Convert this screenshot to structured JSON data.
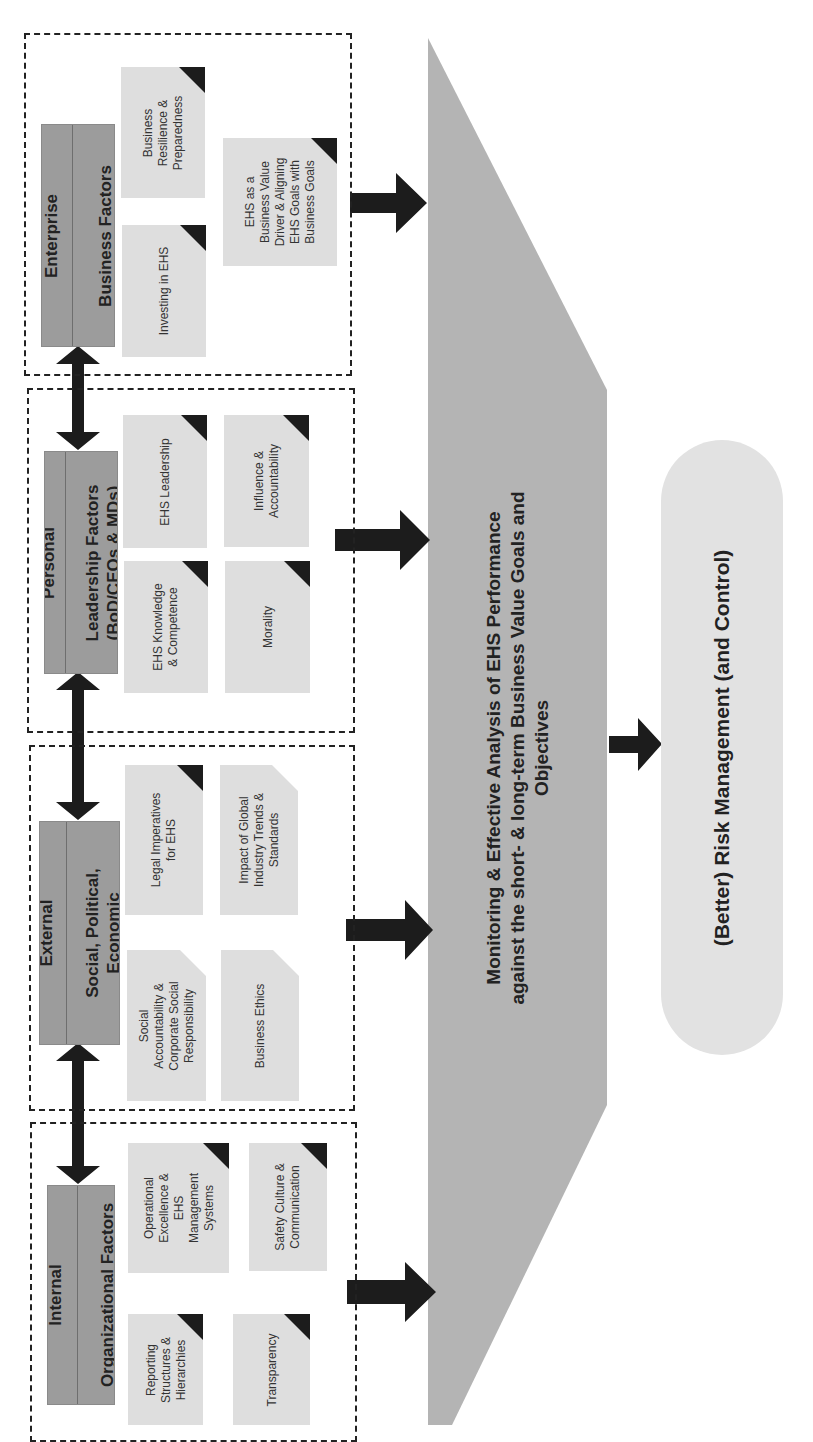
{
  "diagram": {
    "orientation": "rotated -90deg (text reads bottom-to-top)",
    "sections": [
      {
        "id": "enterprise",
        "header": {
          "line1": "Enterprise",
          "line2": "Business Factors"
        },
        "cards": [
          {
            "label": "Business\nResilience &\nPreparedness",
            "marker": "black-corner"
          },
          {
            "label": "Investing in EHS",
            "marker": "black-corner"
          },
          {
            "label": "EHS as a\nBusiness Value\nDriver & Aligning\nEHS Goals with\nBusiness Goals",
            "marker": "black-corner"
          }
        ]
      },
      {
        "id": "personal",
        "header": {
          "line1": "Personal",
          "line2": "Leadership Factors\n(BoD/CEOs & MDs)"
        },
        "cards": [
          {
            "label": "EHS Leadership",
            "marker": "black-corner"
          },
          {
            "label": "EHS Knowledge\n& Competence",
            "marker": "black-corner"
          },
          {
            "label": "Influence &\nAccountability",
            "marker": "black-corner"
          },
          {
            "label": "Morality",
            "marker": "black-corner"
          }
        ]
      },
      {
        "id": "external",
        "header": {
          "line1": "External",
          "line2": "Social, Political,\nEconomic"
        },
        "cards": [
          {
            "label": "Legal Imperatives\nfor EHS",
            "marker": "black-corner"
          },
          {
            "label": "Social\nAccountability &\nCorporate Social\nResponsibility",
            "marker": "folded-corner"
          },
          {
            "label": "Impact of Global\nIndustry Trends &\nStandards",
            "marker": "folded-corner"
          },
          {
            "label": "Business Ethics",
            "marker": "folded-corner"
          }
        ]
      },
      {
        "id": "internal",
        "header": {
          "line1": "Internal",
          "line2": "Organizational Factors"
        },
        "cards": [
          {
            "label": "Operational\nExcellence &\nEHS\nManagement\nSystems",
            "marker": "black-corner"
          },
          {
            "label": "Reporting\nStructures &\nHierarchies",
            "marker": "black-corner"
          },
          {
            "label": "Safety Culture &\nCommunication",
            "marker": "black-corner"
          },
          {
            "label": "Transparency",
            "marker": "black-corner"
          }
        ]
      }
    ],
    "central_block": {
      "label": "Monitoring & Effective Analysis of EHS Performance\nagainst the short- & long-term Business Value Goals and\nObjectives"
    },
    "outcome": {
      "label": "(Better) Risk Management (and Control)"
    },
    "colors": {
      "header_fill": "#9c9c9c",
      "card_fill": "#dedede",
      "central_fill": "#b4b4b4",
      "outcome_fill": "#e2e2e2",
      "arrow": "#1c1c1c",
      "frame": "#222222"
    }
  }
}
